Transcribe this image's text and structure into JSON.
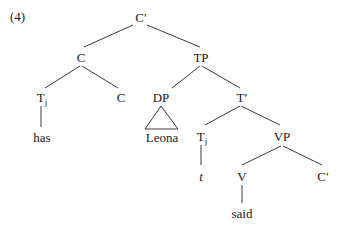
{
  "example_number": "(4)",
  "nodes": {
    "root": "C′",
    "c_left": "C",
    "tp": "TP",
    "tj_top": "T",
    "tj_top_sub": "j",
    "c_inner": "C",
    "dp": "DP",
    "t_bar": "T′",
    "has": "has",
    "leona": "Leona",
    "tj_lower": "T",
    "tj_lower_sub": "j",
    "vp": "VP",
    "trace": "t",
    "v": "V",
    "c_bar_lower": "C′",
    "said": "said"
  },
  "line_color": "#3a3a3a"
}
